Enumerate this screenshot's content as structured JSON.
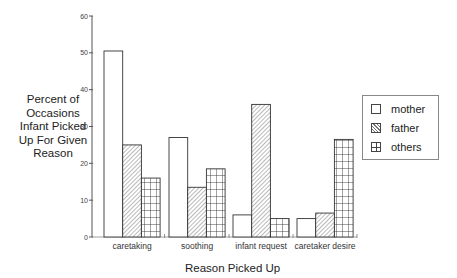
{
  "chart_data": {
    "type": "bar",
    "title": "",
    "xlabel": "Reason Picked Up",
    "ylabel": "Percent of Occasions Infant Picked Up For Given Reason",
    "ylabel_lines": [
      "Percent of",
      "Occasions",
      "Infant Picked",
      "Up For Given",
      "Reason"
    ],
    "categories": [
      "caretaking",
      "soothing",
      "infant request",
      "caretaker desire"
    ],
    "series": [
      {
        "name": "mother",
        "pattern": "plain",
        "values": [
          50.5,
          27,
          6,
          5
        ]
      },
      {
        "name": "father",
        "pattern": "diagonal-hatch",
        "values": [
          25,
          13.5,
          36,
          6.5
        ]
      },
      {
        "name": "others",
        "pattern": "grid",
        "values": [
          16,
          18.5,
          5,
          26.5
        ]
      }
    ],
    "ylim": [
      0,
      60
    ],
    "yticks": [
      0,
      10,
      20,
      30,
      40,
      50,
      60
    ],
    "grid": false,
    "legend_position": "right"
  }
}
